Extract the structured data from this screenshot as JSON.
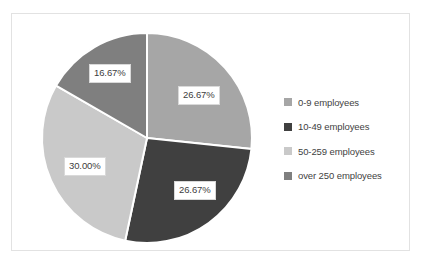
{
  "chart_data": {
    "type": "pie",
    "title": "",
    "subtitle": "",
    "xlabel": "",
    "ylabel": "",
    "grid": false,
    "legend_position": "right",
    "start_angle_deg": 0,
    "direction": "clockwise",
    "categories": [
      "0-9 employees",
      "10-49 employees",
      "50-259 employees",
      "over 250 employees"
    ],
    "values": [
      26.67,
      26.67,
      30.0,
      16.67
    ],
    "value_unit": "percent",
    "data_labels": [
      "26.67%",
      "26.67%",
      "30.00%",
      "16.67%"
    ],
    "colors": [
      "#a6a6a6",
      "#404040",
      "#c9c9c9",
      "#7f7f7f"
    ],
    "slices": [
      {
        "label": "0-9 employees",
        "value": 26.67,
        "data_label": "26.67%",
        "color": "#a6a6a6"
      },
      {
        "label": "10-49 employees",
        "value": 26.67,
        "data_label": "26.67%",
        "color": "#404040"
      },
      {
        "label": "50-259 employees",
        "value": 30.0,
        "data_label": "30.00%",
        "color": "#c9c9c9"
      },
      {
        "label": "over 250 employees",
        "value": 16.67,
        "data_label": "16.67%",
        "color": "#7f7f7f"
      }
    ]
  },
  "legend": {
    "items": [
      {
        "label": "0-9 employees",
        "color": "#a6a6a6"
      },
      {
        "label": "10-49 employees",
        "color": "#404040"
      },
      {
        "label": "50-259 employees",
        "color": "#c9c9c9"
      },
      {
        "label": "over 250 employees",
        "color": "#7f7f7f"
      }
    ]
  },
  "frame": {
    "background": "#ffffff",
    "border_color": "#e2e2e2"
  }
}
